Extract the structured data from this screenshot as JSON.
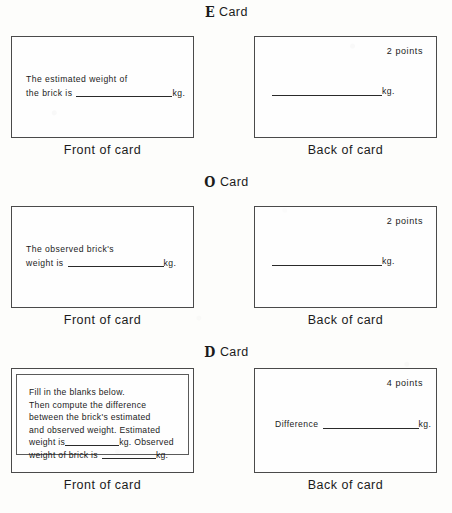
{
  "document": {
    "title": "Weight Estimation Task Cards",
    "caption_front": "Front of card",
    "caption_back": "Back of card",
    "card_word": "Card",
    "unit": "kg."
  },
  "sections": [
    {
      "letter": "E",
      "letter_name": "E",
      "label": "Card",
      "front": {
        "lines": [
          "The estimated weight of",
          "the brick is"
        ],
        "line1": "The estimated weight of",
        "line2_prefix": "the brick is",
        "line2_suffix": "kg."
      },
      "back": {
        "points": "2  points",
        "line_suffix": "kg."
      }
    },
    {
      "letter": "O",
      "letter_name": "O",
      "label": "Card",
      "front": {
        "line1": "The observed brick's",
        "line2_prefix": "weight is",
        "line2_suffix": "kg."
      },
      "back": {
        "points": "2  points",
        "line_suffix": "kg."
      }
    },
    {
      "letter": "D",
      "letter_name": "D",
      "label": "Card",
      "front": {
        "line1": "Fill in the blanks below.",
        "line2": "Then compute the difference",
        "line3": "between the brick's estimated",
        "line4": "and observed weight.  Estimated",
        "line5_prefix": "weight is",
        "line5_mid": "kg.  Observed",
        "line6_prefix": "weight of brick is",
        "line6_suffix": "kg."
      },
      "back": {
        "points": "4  points",
        "line_prefix": "Difference",
        "line_suffix": "kg."
      }
    }
  ]
}
